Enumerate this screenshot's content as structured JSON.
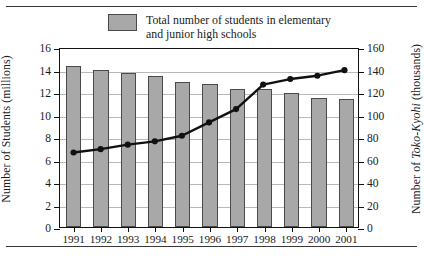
{
  "legend": {
    "bar_label": "Total number of students in elementary\nand junior high schools",
    "line_label_prefix": "Total number of ",
    "line_label_italic": "Toko-Kyohi",
    "bar_swatch_color": "#a8a8a8",
    "line_color": "#111111"
  },
  "axes": {
    "left_title_text": "Number of Students (millions)",
    "right_title_prefix": "Number of ",
    "right_title_italic": "Toko-Kyohi",
    "right_title_suffix": " (thousands)",
    "left_ticks": [
      "0",
      "2",
      "4",
      "6",
      "8",
      "10",
      "12",
      "14",
      "16"
    ],
    "right_ticks": [
      "0",
      "20",
      "40",
      "60",
      "80",
      "100",
      "120",
      "140",
      "160"
    ],
    "x_ticks": [
      "1991",
      "1992",
      "1993",
      "1994",
      "1995",
      "1996",
      "1997",
      "1998",
      "1999",
      "2000",
      "2001"
    ]
  },
  "chart_data": {
    "type": "bar",
    "title": "",
    "xlabel": "",
    "categories": [
      "1991",
      "1992",
      "1993",
      "1994",
      "1995",
      "1996",
      "1997",
      "1998",
      "1999",
      "2000",
      "2001"
    ],
    "grid": true,
    "legend_position": "top",
    "series": [
      {
        "name": "Total number of students in elementary and junior high schools",
        "type": "bar",
        "axis": "left",
        "unit": "millions",
        "ylabel": "Number of Students (millions)",
        "ylim": [
          0,
          16
        ],
        "values": [
          14.3,
          14.0,
          13.7,
          13.4,
          12.9,
          12.7,
          12.3,
          12.3,
          11.9,
          11.5,
          11.4
        ]
      },
      {
        "name": "Total number of Toko-Kyohi",
        "type": "line",
        "axis": "right",
        "unit": "thousands",
        "ylabel": "Number of Toko-Kyohi (thousands)",
        "ylim": [
          0,
          160
        ],
        "values": [
          67,
          70,
          74,
          77,
          82,
          94,
          106,
          128,
          133,
          136,
          141
        ]
      }
    ]
  }
}
